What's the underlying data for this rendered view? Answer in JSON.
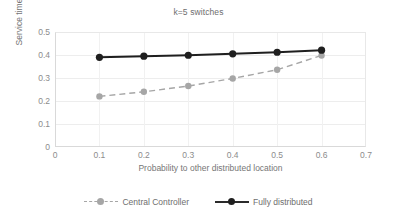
{
  "chart_data": {
    "type": "line",
    "title": "k=5 switches",
    "xlabel": "Probability to other distributed location",
    "ylabel": "Service time",
    "x": [
      0.1,
      0.2,
      0.3,
      0.4,
      0.5,
      0.6
    ],
    "xlim": [
      0,
      0.7
    ],
    "ylim": [
      0,
      0.5
    ],
    "xticks": [
      "0",
      "0.1",
      "0.2",
      "0.3",
      "0.4",
      "0.5",
      "0.6",
      "0.7"
    ],
    "xtick_values": [
      0,
      0.1,
      0.2,
      0.3,
      0.4,
      0.5,
      0.6,
      0.7
    ],
    "yticks": [
      "0",
      "0.1",
      "0.2",
      "0.3",
      "0.4",
      "0.5"
    ],
    "ytick_values": [
      0,
      0.1,
      0.2,
      0.3,
      0.4,
      0.5
    ],
    "grid": true,
    "legend_position": "bottom",
    "series": [
      {
        "name": "Central Controller",
        "values": [
          0.22,
          0.24,
          0.265,
          0.298,
          0.336,
          0.398
        ],
        "color": "#a6a6a6",
        "line_style": "dashed",
        "marker": "circle"
      },
      {
        "name": "Fully distributed",
        "values": [
          0.39,
          0.395,
          0.399,
          0.405,
          0.412,
          0.421
        ],
        "color": "#1f1f1f",
        "line_style": "solid",
        "marker": "circle"
      }
    ]
  },
  "legend": {
    "entries": [
      {
        "label": "Central Controller"
      },
      {
        "label": "Fully distributed"
      }
    ]
  }
}
